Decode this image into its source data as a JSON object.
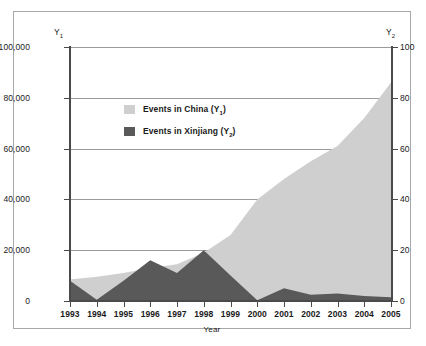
{
  "chart_data": {
    "type": "area",
    "title": "",
    "xlabel": "Year",
    "ylabel": "",
    "x": [
      1993,
      1994,
      1995,
      1996,
      1997,
      1998,
      1999,
      2000,
      2001,
      2002,
      2003,
      2004,
      2005
    ],
    "categories": [
      "1993",
      "1994",
      "1995",
      "1996",
      "1997",
      "1998",
      "1999",
      "2000",
      "2001",
      "2002",
      "2003",
      "2004",
      "2005"
    ],
    "series": [
      {
        "name": "Events in China (Y1)",
        "axis": "y1",
        "color": "#cfcfcf",
        "values": [
          8500,
          9500,
          11000,
          13000,
          14500,
          19000,
          26000,
          40000,
          48000,
          55000,
          61000,
          72000,
          86000
        ]
      },
      {
        "name": "Events in Xinjiang (Y2)",
        "axis": "y2",
        "color": "#595959",
        "values": [
          8,
          0.5,
          8,
          16,
          11,
          20,
          10,
          0.3,
          5,
          2.5,
          3,
          2,
          1.5
        ]
      }
    ],
    "y1_axis": {
      "label": "Y1",
      "ticks": [
        0,
        20000,
        40000,
        60000,
        80000,
        100000
      ],
      "tick_labels": [
        "0",
        "20,000",
        "40,000",
        "60,000",
        "80,000",
        "100,000"
      ],
      "ylim": [
        0,
        100000
      ]
    },
    "y2_axis": {
      "label": "Y2",
      "ticks": [
        0,
        20,
        40,
        60,
        80,
        100
      ],
      "tick_labels": [
        "0",
        "20",
        "40",
        "60",
        "80",
        "100"
      ],
      "ylim": [
        0,
        100
      ]
    },
    "grid": true,
    "legend_position": "upper-left-inside",
    "legend": [
      {
        "label_prefix": "Events in China (Y",
        "label_sub": "1",
        "label_suffix": ")",
        "color": "#cfcfcf"
      },
      {
        "label_prefix": "Events in Xinjiang (Y",
        "label_sub": "2",
        "label_suffix": ")",
        "color": "#595959"
      }
    ]
  },
  "axes": {
    "y1_title_text": "Y",
    "y1_title_sub": "1",
    "y2_title_text": "Y",
    "y2_title_sub": "2",
    "x_title": "Year"
  },
  "colors": {
    "china_area": "#cfcfcf",
    "xinjiang_area": "#595959",
    "gridline": "#9a9a9a",
    "axis": "#4a4a4a",
    "frame_border": "#a8a8a8",
    "text": "#1a1a1a",
    "background": "#ffffff"
  }
}
